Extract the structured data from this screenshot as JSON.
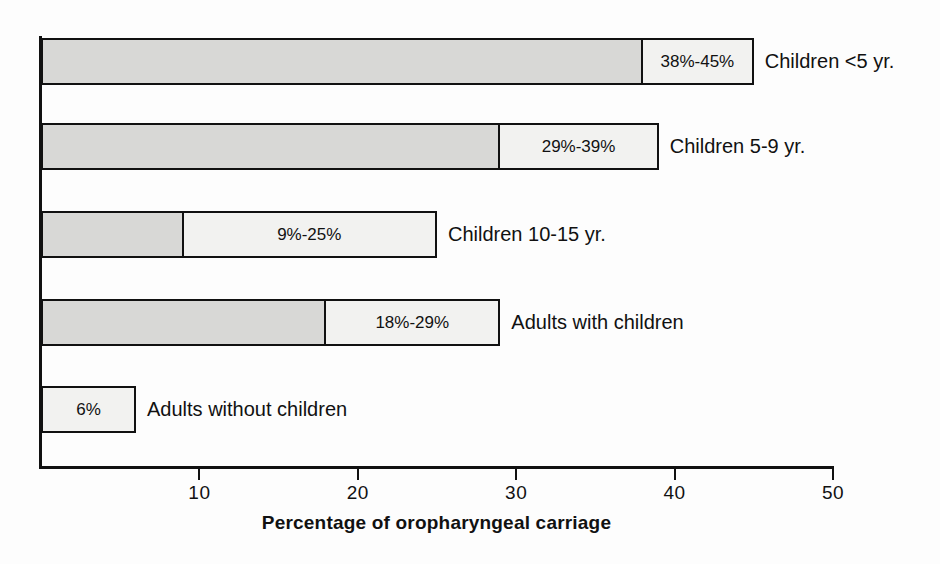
{
  "chart_data": {
    "type": "bar",
    "orientation": "horizontal",
    "title": "",
    "xlabel": "Percentage of oropharyngeal carriage",
    "ylabel": "",
    "xlim": [
      0,
      50
    ],
    "xticks": [
      10,
      20,
      30,
      40,
      50
    ],
    "xtick_labels": [
      "10",
      "20",
      "30",
      "40",
      "50"
    ],
    "grid": false,
    "legend": "none",
    "categories": [
      "Children <5 yr.",
      "Children 5-9 yr.",
      "Children 10-15 yr.",
      "Adults with children",
      "Adults without children"
    ],
    "series": [
      {
        "name": "range low",
        "values": [
          38,
          29,
          9,
          18,
          6
        ]
      },
      {
        "name": "range high",
        "values": [
          45,
          39,
          25,
          29,
          6
        ]
      }
    ],
    "bars": [
      {
        "label": "Children <5 yr.",
        "low": 38,
        "high": 45,
        "value_text": "38%-45%"
      },
      {
        "label": "Children 5-9 yr.",
        "low": 29,
        "high": 39,
        "value_text": "29%-39%"
      },
      {
        "label": "Children 10-15 yr.",
        "low": 9,
        "high": 25,
        "value_text": "9%-25%"
      },
      {
        "label": "Adults with children",
        "low": 18,
        "high": 29,
        "value_text": "18%-29%"
      },
      {
        "label": "Adults without children",
        "low": 6,
        "high": 6,
        "value_text": "6%"
      }
    ],
    "colors": {
      "segment_low_fill": "#d8d8d6",
      "segment_high_fill": "#f2f2f0",
      "outline": "#111111",
      "background": "#fdfdfd",
      "text": "#111111"
    }
  },
  "bars": [
    {
      "value_text": "38%-45%",
      "label": "Children <5 yr."
    },
    {
      "value_text": "29%-39%",
      "label": "Children 5-9 yr."
    },
    {
      "value_text": "9%-25%",
      "label": "Children 10-15 yr."
    },
    {
      "value_text": "18%-29%",
      "label": "Adults with children"
    },
    {
      "value_text": "6%",
      "label": "Adults without children"
    }
  ],
  "axis": {
    "title": "Percentage of oropharyngeal carriage",
    "tick_labels": [
      "10",
      "20",
      "30",
      "40",
      "50"
    ]
  }
}
